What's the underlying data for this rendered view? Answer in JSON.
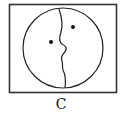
{
  "figure": {
    "option_label": "C",
    "frame": {
      "x": 9,
      "y": 4,
      "width": 108,
      "height": 89
    },
    "circle": {
      "cx": 63,
      "cy": 48,
      "r": 40
    },
    "dots": [
      {
        "cx": 51,
        "cy": 42
      },
      {
        "cx": 73,
        "cy": 27
      }
    ],
    "stroke_color": "#222222"
  }
}
